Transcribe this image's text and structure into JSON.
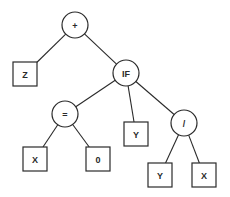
{
  "diagram": {
    "type": "parse-tree",
    "nodes": {
      "plus": {
        "label": "+",
        "kind": "function",
        "cx": 75,
        "cy": 25,
        "r": 13
      },
      "z": {
        "label": "Z",
        "kind": "terminal",
        "cx": 25,
        "cy": 74,
        "size": 24
      },
      "if": {
        "label": "IF",
        "kind": "function",
        "cx": 126,
        "cy": 73,
        "r": 13
      },
      "eq": {
        "label": "=",
        "kind": "function",
        "cx": 65,
        "cy": 114,
        "r": 13
      },
      "y_mid": {
        "label": "Y",
        "kind": "terminal",
        "cx": 136,
        "cy": 134,
        "size": 24
      },
      "div": {
        "label": "/",
        "kind": "function",
        "cx": 184,
        "cy": 123,
        "r": 13
      },
      "x_left": {
        "label": "X",
        "kind": "terminal",
        "cx": 35,
        "cy": 159,
        "size": 24
      },
      "zero": {
        "label": "0",
        "kind": "terminal",
        "cx": 98,
        "cy": 159,
        "size": 24
      },
      "y_bot": {
        "label": "Y",
        "kind": "terminal",
        "cx": 160,
        "cy": 175,
        "size": 24
      },
      "x_bot": {
        "label": "X",
        "kind": "terminal",
        "cx": 204,
        "cy": 175,
        "size": 24
      }
    },
    "edges": [
      [
        "plus",
        "z"
      ],
      [
        "plus",
        "if"
      ],
      [
        "if",
        "eq"
      ],
      [
        "if",
        "y_mid"
      ],
      [
        "if",
        "div"
      ],
      [
        "eq",
        "x_left"
      ],
      [
        "eq",
        "zero"
      ],
      [
        "div",
        "y_bot"
      ],
      [
        "div",
        "x_bot"
      ]
    ],
    "colors": {
      "stroke": "#2a2a2a",
      "background": "#ffffff"
    }
  }
}
